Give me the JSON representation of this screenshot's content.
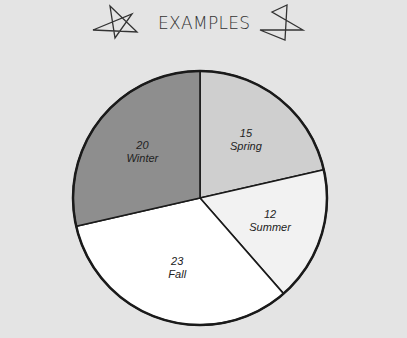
{
  "header": {
    "title": "EXAMPLES",
    "decorations": [
      "star-icon",
      "star-icon"
    ]
  },
  "colors": {
    "background": "#e4e4e4",
    "winter": "#8e8e8e",
    "spring": "#cfcfcf",
    "summer": "#f2f2f2",
    "fall": "#ffffff",
    "outline": "#1a1a1a"
  },
  "chart_data": {
    "type": "pie",
    "title": "EXAMPLES",
    "categories": [
      "Spring",
      "Summer",
      "Fall",
      "Winter"
    ],
    "values": [
      15,
      12,
      23,
      20
    ],
    "labels": [
      {
        "value": "15",
        "name": "Spring"
      },
      {
        "value": "12",
        "name": "Summer"
      },
      {
        "value": "23",
        "name": "Fall"
      },
      {
        "value": "20",
        "name": "Winter"
      }
    ],
    "legend": "none",
    "start_angle": "12 o'clock, clockwise"
  }
}
